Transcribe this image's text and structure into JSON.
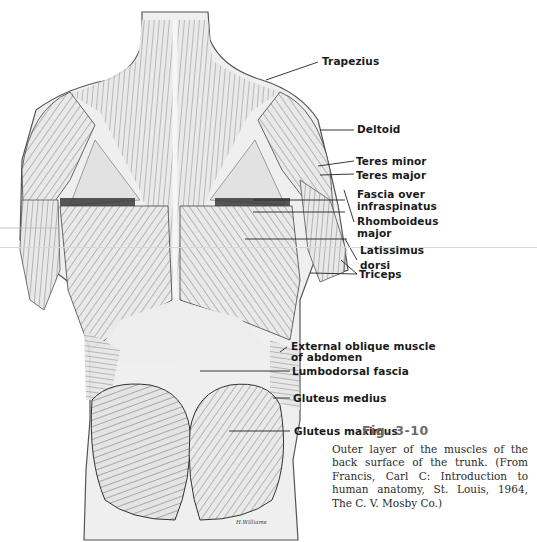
{
  "figure": {
    "number": "Fig. 3-10",
    "caption": "Outer layer of the muscles of the back surface of the trunk. (From Francis, Carl C: Introduction to human anatomy, St. Louis, 1964, The C. V. Mosby Co.)",
    "signature": "H.Williams"
  },
  "labels": [
    {
      "id": "trapezius",
      "lines": [
        "Trapezius"
      ]
    },
    {
      "id": "deltoid",
      "lines": [
        "Deltoid"
      ]
    },
    {
      "id": "teres-minor",
      "lines": [
        "Teres minor"
      ]
    },
    {
      "id": "teres-major",
      "lines": [
        "Teres major"
      ]
    },
    {
      "id": "fascia-infraspinatus",
      "lines": [
        "Fascia over",
        "infraspinatus"
      ]
    },
    {
      "id": "rhomboideus-major",
      "lines": [
        "Rhomboideus",
        "major"
      ]
    },
    {
      "id": "latissimus-dorsi",
      "lines": [
        "Latissimus",
        "dorsi"
      ]
    },
    {
      "id": "triceps",
      "lines": [
        "Triceps"
      ]
    },
    {
      "id": "external-oblique",
      "lines": [
        "External oblique muscle",
        "of abdomen"
      ]
    },
    {
      "id": "lumbodorsal-fascia",
      "lines": [
        "Lumbodorsal fascia"
      ]
    },
    {
      "id": "gluteus-medius",
      "lines": [
        "Gluteus medius"
      ]
    },
    {
      "id": "gluteus-maximus",
      "lines": [
        "Gluteus maximus"
      ]
    }
  ]
}
